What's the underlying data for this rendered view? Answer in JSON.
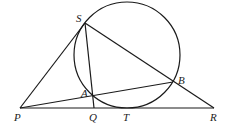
{
  "diagram": {
    "type": "geometry",
    "circle": {
      "cx": 127,
      "cy": 55,
      "r": 53
    },
    "points": {
      "S": {
        "x": 85,
        "y": 23,
        "label": "S",
        "lx": 76,
        "ly": 22
      },
      "P": {
        "x": 20,
        "y": 108,
        "label": "P",
        "lx": 14,
        "ly": 121
      },
      "Q": {
        "x": 94,
        "y": 108,
        "label": "Q",
        "lx": 89,
        "ly": 121
      },
      "T": {
        "x": 127,
        "y": 108,
        "label": "T",
        "lx": 123,
        "ly": 121
      },
      "R": {
        "x": 214,
        "y": 108,
        "label": "R",
        "lx": 210,
        "ly": 121
      },
      "A": {
        "x": 93,
        "y": 96,
        "label": "A",
        "lx": 81,
        "ly": 97
      },
      "B": {
        "x": 173,
        "y": 82,
        "label": "B",
        "lx": 178,
        "ly": 84
      }
    },
    "labels": [
      "S",
      "P",
      "Q",
      "T",
      "R",
      "A",
      "B"
    ],
    "segments": [
      [
        "P",
        "S"
      ],
      [
        "S",
        "R"
      ],
      [
        "P",
        "R"
      ],
      [
        "S",
        "Q"
      ],
      [
        "P",
        "B"
      ]
    ]
  }
}
